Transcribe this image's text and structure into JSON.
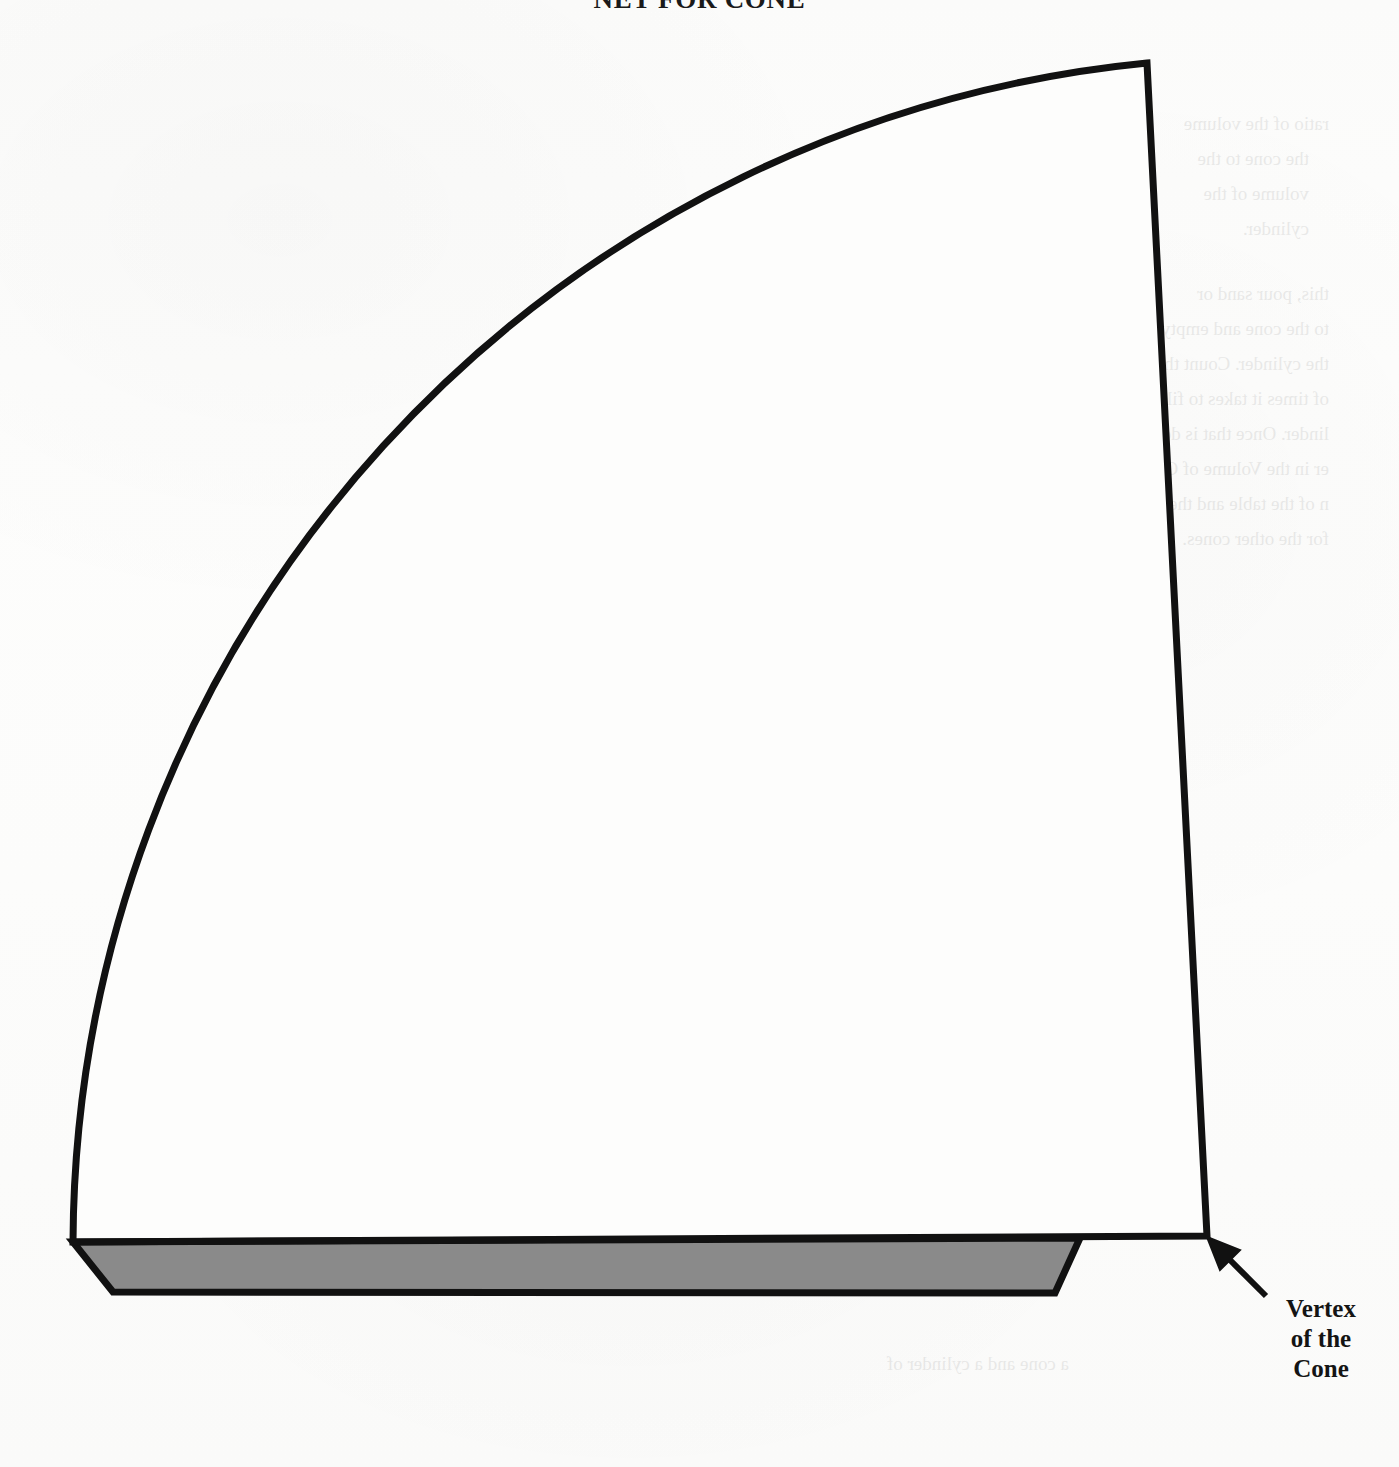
{
  "figure": {
    "title": "NET FOR CONE",
    "kind": "geometry-net-diagram",
    "background_color": "#fdfdfc",
    "ink_color": "#111111",
    "shaded_band_color": "#8a8a8a"
  },
  "callout": {
    "name": "vertex-callout",
    "lines": [
      "Vertex",
      "of the",
      "Cone"
    ],
    "arrow": {
      "from_x": 1266,
      "from_y": 1296,
      "to_x": 1209,
      "to_y": 1239
    }
  },
  "geometry": {
    "sector": {
      "description": "circular sector forming the lateral surface of the cone",
      "vertex_x": 1207,
      "vertex_y": 1236,
      "arc_start_x": 73,
      "arc_start_y": 1242,
      "arc_end_x": 1147,
      "arc_end_y": 63,
      "radius": 1190
    },
    "baseline": {
      "description": "straight edge from arc start to cone vertex",
      "x1": 73,
      "y1": 1242,
      "x2": 1207,
      "y2": 1236
    },
    "shaded_band": {
      "description": "shaded trapezoidal flap below the sector baseline",
      "points": "73,1242 1080,1238 1055,1293 113,1292"
    }
  },
  "ghost_text": {
    "note": "faint bleed-through text from the reverse page of the scan",
    "right_column": [
      "ratio of the volume",
      "the cone to the",
      "volume of the",
      "cylinder.",
      "this, pour sand or",
      "to the cone and empty",
      "the cylinder. Count the",
      "of times it takes to fill",
      "linder. Once that is done,",
      "er in the Volume of Cone",
      "n of the table and then do",
      "for the other cones."
    ],
    "table_headers": [
      "Volume of Cone",
      "Volume of Cylinder"
    ],
    "table_cells": [
      "2",
      "4",
      "3",
      "8 x 0",
      "3 x 2"
    ],
    "footer_line": "a cone and a cylinder of"
  }
}
